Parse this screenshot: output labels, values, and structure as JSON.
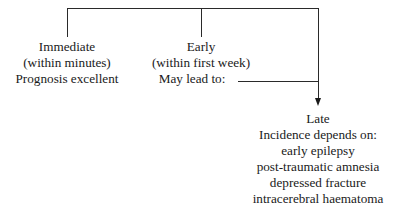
{
  "diagram": {
    "nodes": {
      "immediate": {
        "title": "Immediate",
        "lines": [
          "(within minutes)",
          "Prognosis excellent"
        ]
      },
      "early": {
        "title": "Early",
        "lines": [
          "(within first week)",
          "May lead to:"
        ]
      },
      "late": {
        "title": "Late",
        "lines": [
          "Incidence depends on:",
          "early epilepsy",
          "post-traumatic amnesia",
          "depressed fracture",
          "intracerebral haematoma"
        ]
      }
    },
    "edges": [
      {
        "from": "root",
        "to": "immediate"
      },
      {
        "from": "root",
        "to": "early"
      },
      {
        "from": "root",
        "to": "late"
      },
      {
        "from": "early",
        "to": "late",
        "arrow": true
      }
    ]
  }
}
